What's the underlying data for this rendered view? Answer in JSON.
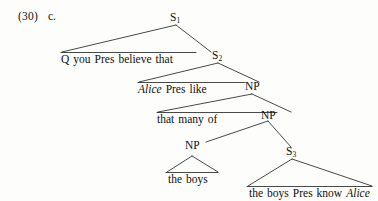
{
  "example": {
    "number": "(30)",
    "letter": "c."
  },
  "figure": {
    "type": "syntax-tree",
    "ink_color": "#1a1a1a",
    "background_color": "#fdfdfc",
    "nodes": [
      {
        "id": "s1",
        "label": "S",
        "subscript": "1"
      },
      {
        "id": "s2",
        "label": "S",
        "subscript": "2"
      },
      {
        "id": "np1",
        "label": "NP",
        "subscript": ""
      },
      {
        "id": "np2",
        "label": "NP",
        "subscript": ""
      },
      {
        "id": "np3",
        "label": "NP",
        "subscript": ""
      },
      {
        "id": "s3",
        "label": "S",
        "subscript": "3"
      }
    ],
    "terminals": [
      {
        "id": "t1",
        "words": [
          {
            "text": "Q",
            "italic": false
          },
          {
            "text": "you",
            "italic": false
          },
          {
            "text": "Pres",
            "italic": false
          },
          {
            "text": "believe",
            "italic": false
          },
          {
            "text": "that",
            "italic": false
          }
        ]
      },
      {
        "id": "t2",
        "words": [
          {
            "text": "Alice",
            "italic": true
          },
          {
            "text": "Pres",
            "italic": false
          },
          {
            "text": "like",
            "italic": false
          }
        ]
      },
      {
        "id": "t3",
        "words": [
          {
            "text": "that",
            "italic": false
          },
          {
            "text": "many",
            "italic": false
          },
          {
            "text": "of",
            "italic": false
          }
        ]
      },
      {
        "id": "t4",
        "words": [
          {
            "text": "the",
            "italic": false
          },
          {
            "text": "boys",
            "italic": false
          }
        ]
      },
      {
        "id": "t5",
        "words": [
          {
            "text": "the",
            "italic": false
          },
          {
            "text": "boys",
            "italic": false
          },
          {
            "text": "Pres",
            "italic": false
          },
          {
            "text": "know",
            "italic": false
          },
          {
            "text": "Alice",
            "italic": true
          }
        ]
      }
    ]
  }
}
